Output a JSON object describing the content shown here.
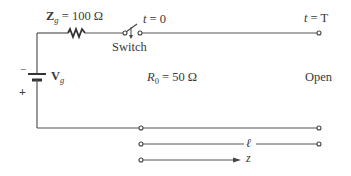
{
  "diagram": {
    "type": "transmission-line-circuit",
    "generator": {
      "impedance_symbol": "Z",
      "impedance_subscript": "g",
      "impedance_value": "= 100 Ω",
      "voltage_symbol": "V",
      "voltage_subscript": "g",
      "polarity_top": "−",
      "polarity_bottom": "+"
    },
    "switch": {
      "label": "Switch",
      "time_label": "t",
      "time_value": "= 0"
    },
    "line": {
      "characteristic_impedance_symbol": "R",
      "characteristic_impedance_subscript": "0",
      "characteristic_impedance_value": "= 50 Ω",
      "end_time_label": "t",
      "end_time_value": "= T",
      "termination": "Open",
      "length_symbol": "ℓ",
      "axis_symbol": "z"
    },
    "colors": {
      "wire": "#555555",
      "text": "#3a3a3a",
      "background": "#ffffff"
    }
  }
}
